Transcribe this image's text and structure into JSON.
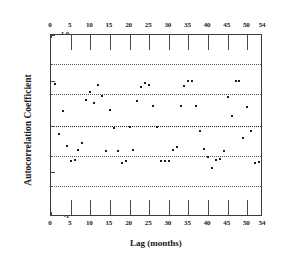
{
  "chart_data": {
    "type": "scatter",
    "title": "",
    "xlabel": "Lag (months)",
    "ylabel": "Autocorrelation Coefficient",
    "xlim": [
      0,
      54
    ],
    "ylim": [
      -1,
      1
    ],
    "grid": false,
    "legend": null,
    "x_ticks_top": [
      "0",
      "5",
      "10",
      "15",
      "20",
      "25",
      "30",
      "35",
      "40",
      "45",
      "50",
      "54"
    ],
    "x_tick_values_top": [
      0,
      5,
      10,
      15,
      20,
      25,
      30,
      35,
      40,
      45,
      50,
      54
    ],
    "x_ticks_bottom": [
      "0",
      "5",
      "10",
      "15",
      "20",
      "25",
      "30",
      "35",
      "40",
      "45",
      "50",
      "54"
    ],
    "x_tick_values_bottom": [
      0,
      5,
      10,
      15,
      20,
      25,
      30,
      35,
      40,
      45,
      50,
      54
    ],
    "y_ticks": [
      "1.0",
      "0.5",
      "0",
      "-0.5",
      "-1"
    ],
    "y_tick_values": [
      1.0,
      0.5,
      0,
      -0.5,
      -1
    ],
    "reference_lines": [
      {
        "name": "upper-outer-band",
        "value": 0.68,
        "style": "dotted"
      },
      {
        "name": "upper-inner-band",
        "value": 0.35,
        "style": "dotted"
      },
      {
        "name": "zero-line",
        "value": 0,
        "style": "dotted"
      },
      {
        "name": "lower-inner-band",
        "value": -0.33,
        "style": "dotted"
      },
      {
        "name": "lower-outer-band",
        "value": -0.66,
        "style": "dotted"
      }
    ],
    "series": [
      {
        "name": "Autocorrelation",
        "marker": "dot",
        "color": "#1d1d1d",
        "points": [
          [
            1,
            0.46
          ],
          [
            2,
            -0.09
          ],
          [
            3,
            0.17
          ],
          [
            4,
            -0.22
          ],
          [
            5,
            -0.39
          ],
          [
            6,
            -0.37
          ],
          [
            7,
            -0.26
          ],
          [
            8,
            -0.19
          ],
          [
            9,
            0.29
          ],
          [
            10,
            0.37
          ],
          [
            11,
            0.25
          ],
          [
            12,
            0.45
          ],
          [
            13,
            0.33
          ],
          [
            14,
            -0.27
          ],
          [
            15,
            0.18
          ],
          [
            16,
            -0.02
          ],
          [
            17,
            -0.27
          ],
          [
            18,
            -0.41
          ],
          [
            19,
            -0.39
          ],
          [
            20,
            -0.01
          ],
          [
            21,
            -0.26
          ],
          [
            22,
            0.28
          ],
          [
            23,
            0.43
          ],
          [
            24,
            0.47
          ],
          [
            25,
            0.45
          ],
          [
            26,
            0.22
          ],
          [
            27,
            -0.01
          ],
          [
            28,
            -0.39
          ],
          [
            29,
            -0.38
          ],
          [
            30,
            -0.38
          ],
          [
            31,
            -0.26
          ],
          [
            32,
            -0.23
          ],
          [
            33,
            0.22
          ],
          [
            34,
            0.44
          ],
          [
            35,
            0.5
          ],
          [
            36,
            0.5
          ],
          [
            37,
            0.22
          ],
          [
            38,
            -0.06
          ],
          [
            39,
            -0.25
          ],
          [
            40,
            -0.34
          ],
          [
            41,
            -0.46
          ],
          [
            42,
            -0.37
          ],
          [
            43,
            -0.36
          ],
          [
            44,
            -0.28
          ],
          [
            45,
            0.32
          ],
          [
            46,
            0.11
          ],
          [
            47,
            0.49
          ],
          [
            48,
            0.49
          ],
          [
            49,
            -0.13
          ],
          [
            50,
            0.21
          ],
          [
            51,
            -0.06
          ],
          [
            52,
            -0.41
          ],
          [
            53,
            -0.4
          ]
        ]
      }
    ]
  }
}
